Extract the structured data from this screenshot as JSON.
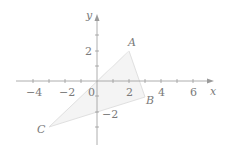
{
  "diagram": {
    "type": "coordinate-plane-triangle",
    "axes": {
      "x_label": "x",
      "y_label": "y",
      "origin_label": "0",
      "x_ticks": [
        {
          "value": -4,
          "label": "−4"
        },
        {
          "value": -2,
          "label": "−2"
        },
        {
          "value": 2,
          "label": "2"
        },
        {
          "value": 4,
          "label": "4"
        },
        {
          "value": 6,
          "label": "6"
        }
      ],
      "y_ticks": [
        {
          "value": 2,
          "label": "2"
        },
        {
          "value": -2,
          "label": "−2"
        }
      ]
    },
    "points": [
      {
        "label": "A",
        "x": 2,
        "y": 2
      },
      {
        "label": "B",
        "x": 3,
        "y": -1
      },
      {
        "label": "C",
        "x": -3,
        "y": -3
      }
    ],
    "colors": {
      "axis": "#9a9a9a",
      "triangle_fill": "#f3f3f3",
      "triangle_stroke": "#e2e2e2",
      "text": "#7a7a7a"
    }
  }
}
